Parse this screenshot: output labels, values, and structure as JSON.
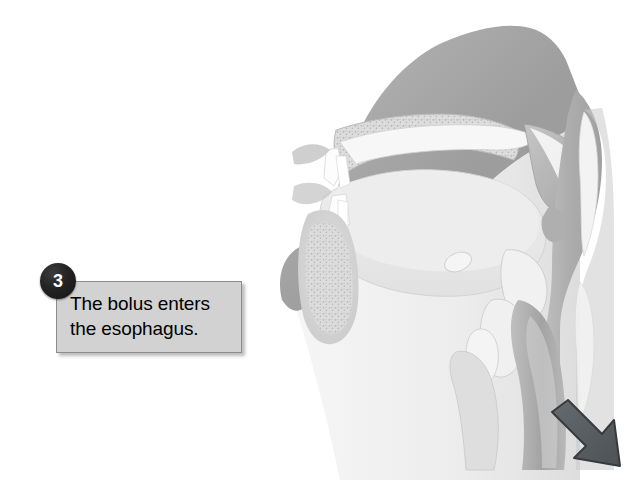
{
  "figure": {
    "background_color": "#ffffff",
    "width": 643,
    "height": 497,
    "style": "grayscale medical illustration"
  },
  "callout": {
    "step_number": "3",
    "text": "The bolus enters\nthe esophagus.",
    "box_fill_color": "#d2d2d2",
    "box_border_color": "#8d8d8d",
    "badge_fill_color": "#1c1c1c",
    "badge_text_color": "#ffffff",
    "text_color": "#000000"
  },
  "illustration": {
    "arrow": {
      "name": "bolus-direction-arrow",
      "direction": "down-right",
      "color": "#555b5e",
      "outline_color": "#2e3133",
      "meaning": "direction of bolus travel down the esophagus"
    },
    "parts": [
      {
        "name": "nasal-cavity-and-face",
        "tone": "#9a9a9a"
      },
      {
        "name": "hard-palate",
        "tone": "#cfcfcf"
      },
      {
        "name": "soft-palate",
        "tone": "#b4b4b4"
      },
      {
        "name": "uvula",
        "tone": "#b0b0b0"
      },
      {
        "name": "tongue",
        "tone": "#e3e3e3"
      },
      {
        "name": "mandible-bone",
        "tone": "#d8d8d8"
      },
      {
        "name": "oral-cavity",
        "tone": "#ededed"
      },
      {
        "name": "pharynx",
        "tone": "#b8b8b8"
      },
      {
        "name": "epiglottis",
        "tone": "#f0f0f0"
      },
      {
        "name": "hyoid-bone",
        "tone": "#f2f2f2"
      },
      {
        "name": "larynx-thyroid-cartilage",
        "tone": "#efefef"
      },
      {
        "name": "trachea",
        "tone": "#d5d5d5"
      },
      {
        "name": "esophagus",
        "tone": "#a9a9a9"
      },
      {
        "name": "cervical-vertebrae",
        "tone": "#c6c6c6"
      },
      {
        "name": "neck-soft-tissue",
        "tone": "#ebebeb"
      }
    ]
  }
}
